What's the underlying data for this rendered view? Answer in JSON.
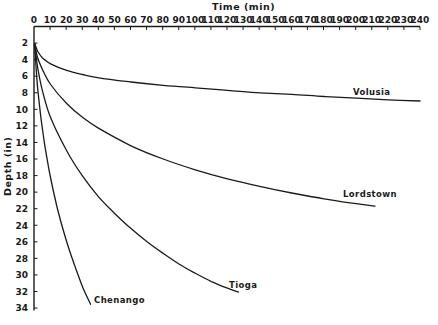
{
  "chart_data": {
    "type": "line",
    "title": "",
    "xlabel": "Time (min)",
    "ylabel": "Depth (in)",
    "xlim": [
      0,
      240
    ],
    "ylim": [
      34,
      0
    ],
    "x_axis_position": "top",
    "y_axis_inverted": true,
    "grid": false,
    "legend": "inline labels at curve ends",
    "x_ticks": [
      0,
      10,
      20,
      30,
      40,
      50,
      60,
      70,
      80,
      90,
      100,
      110,
      120,
      130,
      140,
      150,
      160,
      170,
      180,
      190,
      200,
      210,
      220,
      230,
      240
    ],
    "y_ticks": [
      2,
      4,
      6,
      8,
      10,
      12,
      14,
      16,
      18,
      20,
      22,
      24,
      26,
      28,
      30,
      32,
      34
    ],
    "series": [
      {
        "name": "Volusia",
        "x": [
          0,
          2,
          5,
          10,
          20,
          30,
          40,
          60,
          80,
          100,
          120,
          140,
          160,
          180,
          200,
          220,
          240
        ],
        "y": [
          2.0,
          3.0,
          3.8,
          4.5,
          5.3,
          5.8,
          6.2,
          6.7,
          7.1,
          7.4,
          7.7,
          8.0,
          8.2,
          8.45,
          8.65,
          8.85,
          9.0
        ]
      },
      {
        "name": "Lordstown",
        "x": [
          0,
          2,
          5,
          10,
          20,
          30,
          40,
          60,
          80,
          100,
          120,
          140,
          160,
          180,
          200,
          212
        ],
        "y": [
          2.0,
          3.8,
          5.2,
          7.0,
          9.3,
          11.0,
          12.3,
          14.4,
          16.0,
          17.3,
          18.4,
          19.3,
          20.1,
          20.8,
          21.4,
          21.7
        ]
      },
      {
        "name": "Tioga",
        "x": [
          0,
          2,
          5,
          10,
          20,
          30,
          40,
          50,
          60,
          70,
          80,
          90,
          100,
          110,
          120,
          127
        ],
        "y": [
          2.0,
          5.0,
          7.8,
          11.0,
          15.0,
          18.1,
          20.6,
          22.6,
          24.4,
          26.0,
          27.4,
          28.7,
          29.8,
          30.8,
          31.6,
          32.1
        ]
      },
      {
        "name": "Chenango",
        "x": [
          0,
          1,
          2,
          4,
          6,
          8,
          10,
          14,
          18,
          22,
          26,
          30,
          35
        ],
        "y": [
          2.0,
          5.0,
          7.5,
          11.0,
          13.8,
          16.2,
          18.3,
          21.8,
          24.7,
          27.2,
          29.4,
          31.5,
          33.6
        ]
      }
    ]
  },
  "axes": {
    "x_title": "Time (min)",
    "y_title": "Depth (in)"
  },
  "labels": {
    "volusia": "Volusia",
    "lordstown": "Lordstown",
    "tioga": "Tioga",
    "chenango": "Chenango"
  }
}
